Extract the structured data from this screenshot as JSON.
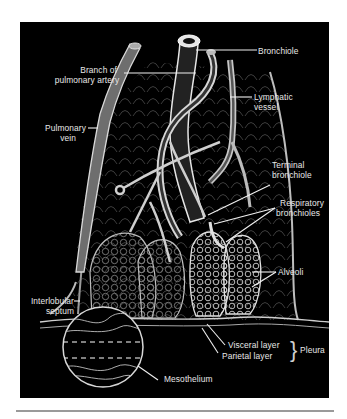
{
  "figure": {
    "colors": {
      "background": "#000000",
      "structure": "#dcdcdc",
      "label": "#e8e8e8",
      "rule": "#9a9a9a"
    },
    "labels": {
      "bronchiole": "Bronchiole",
      "branch_of_pulmonary_artery_line1": "Branch of",
      "branch_of_pulmonary_artery_line2": "pulmonary artery",
      "lymphatic_vessel_line1": "Lymphatic",
      "lymphatic_vessel_line2": "vessel",
      "pulmonary_vein_line1": "Pulmonary",
      "pulmonary_vein_line2": "vein",
      "terminal_bronchiole_line1": "Terminal",
      "terminal_bronchiole_line2": "bronchiole",
      "respiratory_bronchioles_line1": "Respiratory",
      "respiratory_bronchioles_line2": "bronchioles",
      "alveoli": "Alveoli",
      "interlobular_septum_line1": "Interlobular",
      "interlobular_septum_line2": "septum",
      "visceral_layer": "Visceral layer",
      "parietal_layer": "Parietal layer",
      "pleura": "Pleura",
      "pleura_brace": "}",
      "mesothelium": "Mesothelium"
    }
  }
}
